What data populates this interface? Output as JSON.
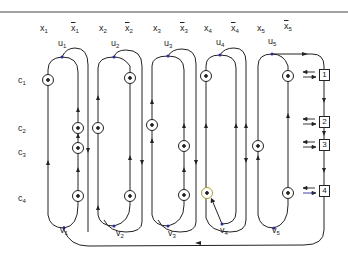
{
  "diagram": {
    "variable_labels": [
      {
        "id": "x1",
        "base": "x",
        "sub": "1",
        "negated": false,
        "x": 40,
        "y": 26
      },
      {
        "id": "x1bar",
        "base": "x",
        "sub": "1",
        "negated": true,
        "x": 71,
        "y": 24
      },
      {
        "id": "x2",
        "base": "x",
        "sub": "2",
        "negated": false,
        "x": 99,
        "y": 26
      },
      {
        "id": "x2bar",
        "base": "x",
        "sub": "2",
        "negated": true,
        "x": 125,
        "y": 24
      },
      {
        "id": "x3",
        "base": "x",
        "sub": "3",
        "negated": false,
        "x": 153,
        "y": 26
      },
      {
        "id": "x3bar",
        "base": "x",
        "sub": "3",
        "negated": true,
        "x": 180,
        "y": 24
      },
      {
        "id": "x4",
        "base": "x",
        "sub": "4",
        "negated": false,
        "x": 204,
        "y": 26
      },
      {
        "id": "x4bar",
        "base": "x",
        "sub": "4",
        "negated": true,
        "x": 231,
        "y": 24
      },
      {
        "id": "x5",
        "base": "x",
        "sub": "5",
        "negated": false,
        "x": 257,
        "y": 26
      },
      {
        "id": "x5bar",
        "base": "x",
        "sub": "5",
        "negated": true,
        "x": 284,
        "y": 24
      }
    ],
    "u_labels": [
      {
        "id": "u1",
        "base": "u",
        "sub": "1",
        "x": 58,
        "y": 39
      },
      {
        "id": "u2",
        "base": "u",
        "sub": "2",
        "x": 111,
        "y": 39
      },
      {
        "id": "u3",
        "base": "u",
        "sub": "3",
        "x": 164,
        "y": 39
      },
      {
        "id": "u4",
        "base": "u",
        "sub": "4",
        "x": 216,
        "y": 39
      },
      {
        "id": "u5",
        "base": "u",
        "sub": "5",
        "x": 268,
        "y": 39
      }
    ],
    "clause_labels": [
      {
        "id": "c1",
        "base": "c",
        "sub": "1",
        "x": 18,
        "y": 76
      },
      {
        "id": "c2",
        "base": "c",
        "sub": "2",
        "x": 18,
        "y": 124
      },
      {
        "id": "c3",
        "base": "c",
        "sub": "3",
        "x": 18,
        "y": 148
      },
      {
        "id": "c4",
        "base": "c",
        "sub": "4",
        "x": 18,
        "y": 194
      }
    ],
    "v_labels": [
      {
        "id": "v1",
        "base": "v",
        "sub": "1",
        "x": 60,
        "y": 225
      },
      {
        "id": "v2",
        "base": "v",
        "sub": "2",
        "x": 116,
        "y": 229
      },
      {
        "id": "v3",
        "base": "v",
        "sub": "3",
        "x": 168,
        "y": 229
      },
      {
        "id": "v4",
        "base": "v",
        "sub": "4",
        "x": 220,
        "y": 226
      },
      {
        "id": "v5",
        "base": "v",
        "sub": "5",
        "x": 272,
        "y": 226
      }
    ],
    "clause_boxes": [
      {
        "id": "box1",
        "label": "1",
        "x": 319,
        "y": 69
      },
      {
        "id": "box2",
        "label": "2",
        "x": 319,
        "y": 116
      },
      {
        "id": "box3",
        "label": "3",
        "x": 319,
        "y": 139
      },
      {
        "id": "box4",
        "label": "4",
        "x": 319,
        "y": 185
      }
    ],
    "colors": {
      "line": "#222222",
      "node_dot_blue": "#2a2a9a",
      "highlight_yellow": "#c8c040",
      "background": "#ffffff"
    }
  }
}
